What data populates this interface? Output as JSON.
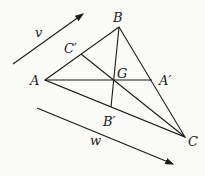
{
  "diagram": {
    "points": {
      "A": {
        "label": "A",
        "x": 45,
        "y": 80
      },
      "B": {
        "label": "B",
        "x": 119,
        "y": 27
      },
      "C": {
        "label": "C",
        "x": 185,
        "y": 137
      },
      "C_prime": {
        "label": "C′",
        "x": 81,
        "y": 54
      },
      "G": {
        "label": "G",
        "x": 114,
        "y": 80
      },
      "A_prime": {
        "label": "A′",
        "x": 152,
        "y": 80
      },
      "B_prime": {
        "label": "B′",
        "x": 111,
        "y": 107
      }
    },
    "vectors": {
      "v": {
        "label": "v",
        "from": [
          13,
          64
        ],
        "to": [
          83,
          14
        ]
      },
      "w": {
        "label": "w",
        "from": [
          37,
          108
        ],
        "to": [
          173,
          164
        ]
      }
    },
    "stroke_color": "#1a1a1a"
  }
}
